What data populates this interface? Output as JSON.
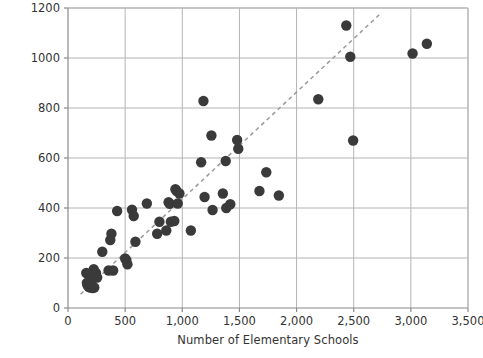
{
  "chart_data": {
    "type": "scatter",
    "title": "",
    "xlabel": "Number of Elementary Schools",
    "ylabel": "Number of High Schools",
    "xlim": [
      0,
      3500
    ],
    "ylim": [
      0,
      1200
    ],
    "xticks": [
      0,
      500,
      1000,
      1500,
      2000,
      2500,
      3000,
      3500
    ],
    "xticklabels": [
      "0",
      "500",
      "1,000",
      "1,500",
      "2,000",
      "2,500",
      "3,000",
      "3,500"
    ],
    "yticks": [
      0,
      200,
      400,
      600,
      800,
      1000,
      1200
    ],
    "yticklabels": [
      "0",
      "200",
      "400",
      "600",
      "800",
      "1000",
      "1200"
    ],
    "grid": true,
    "grid_color": "#b4b4b4",
    "legend": null,
    "marker_color": "#3a3a3a",
    "marker_size": 5.2,
    "trendline": {
      "style": "dashed",
      "color": "#9a9a9a",
      "x_start": 110,
      "y_start": 55,
      "x_end": 2740,
      "y_end": 1180
    },
    "points": [
      [
        160,
        140
      ],
      [
        165,
        100
      ],
      [
        170,
        92
      ],
      [
        180,
        85
      ],
      [
        190,
        112
      ],
      [
        195,
        82
      ],
      [
        200,
        88
      ],
      [
        205,
        96
      ],
      [
        215,
        80
      ],
      [
        225,
        155
      ],
      [
        230,
        82
      ],
      [
        240,
        128
      ],
      [
        245,
        140
      ],
      [
        255,
        122
      ],
      [
        300,
        225
      ],
      [
        355,
        150
      ],
      [
        370,
        272
      ],
      [
        380,
        297
      ],
      [
        395,
        150
      ],
      [
        430,
        388
      ],
      [
        500,
        198
      ],
      [
        510,
        192
      ],
      [
        520,
        175
      ],
      [
        560,
        393
      ],
      [
        575,
        368
      ],
      [
        590,
        265
      ],
      [
        690,
        418
      ],
      [
        780,
        297
      ],
      [
        800,
        345
      ],
      [
        860,
        310
      ],
      [
        880,
        423
      ],
      [
        890,
        417
      ],
      [
        900,
        345
      ],
      [
        930,
        348
      ],
      [
        940,
        475
      ],
      [
        950,
        468
      ],
      [
        960,
        418
      ],
      [
        975,
        458
      ],
      [
        1075,
        310
      ],
      [
        1165,
        583
      ],
      [
        1185,
        828
      ],
      [
        1195,
        444
      ],
      [
        1255,
        690
      ],
      [
        1265,
        392
      ],
      [
        1355,
        458
      ],
      [
        1380,
        588
      ],
      [
        1385,
        400
      ],
      [
        1420,
        415
      ],
      [
        1480,
        672
      ],
      [
        1490,
        637
      ],
      [
        1675,
        468
      ],
      [
        1735,
        543
      ],
      [
        1845,
        450
      ],
      [
        2190,
        835
      ],
      [
        2435,
        1130
      ],
      [
        2470,
        1005
      ],
      [
        2495,
        670
      ],
      [
        3015,
        1018
      ],
      [
        3140,
        1057
      ]
    ]
  },
  "axis": {
    "x_title": "Number of Elementary Schools",
    "y_title": "Number of High Schools"
  }
}
